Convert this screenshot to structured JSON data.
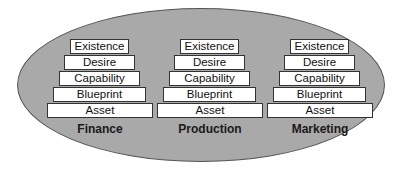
{
  "diagram": {
    "levels": [
      "Existence",
      "Desire",
      "Capability",
      "Blueprint",
      "Asset"
    ],
    "columns": [
      {
        "label": "Finance"
      },
      {
        "label": "Production"
      },
      {
        "label": "Marketing"
      }
    ],
    "colors": {
      "ellipse_fill": "#a9a9a9",
      "box_fill": "#ffffff",
      "border": "#333333"
    }
  }
}
